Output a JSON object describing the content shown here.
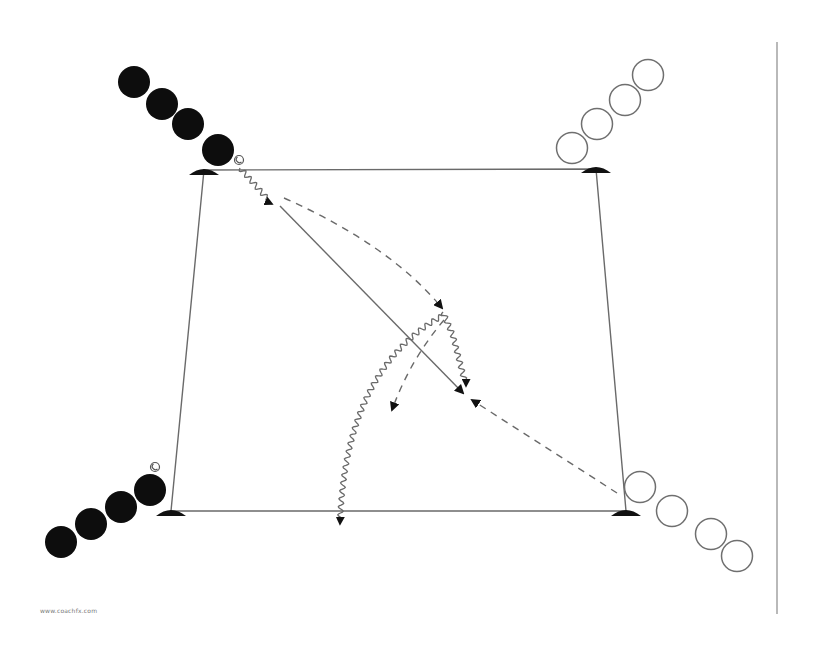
{
  "diagram": {
    "colors": {
      "line": "#6a6a6a",
      "dark_player": "#0d0d0d",
      "light_player_stroke": "#6f6f6f",
      "cone": "#111111",
      "arrow": "#111111",
      "divider": "#8a8a8a"
    },
    "pitch": {
      "corners": [
        {
          "name": "top-left",
          "x": 204,
          "y": 170
        },
        {
          "name": "top-right",
          "x": 596,
          "y": 169
        },
        {
          "name": "bottom-right",
          "x": 626,
          "y": 511
        },
        {
          "name": "bottom-left",
          "x": 171,
          "y": 511
        }
      ]
    },
    "cones": [
      {
        "name": "cone-top-left",
        "x": 204,
        "y": 172
      },
      {
        "name": "cone-top-right",
        "x": 596,
        "y": 170
      },
      {
        "name": "cone-bottom-left",
        "x": 171,
        "y": 513
      },
      {
        "name": "cone-bottom-right",
        "x": 626,
        "y": 513
      }
    ],
    "teams": {
      "dark": {
        "label": "Team A (filled)",
        "groups": [
          {
            "name": "dark-group-top-left",
            "players": [
              [
                134,
                82
              ],
              [
                162,
                104
              ],
              [
                188,
                124
              ],
              [
                218,
                150
              ]
            ]
          },
          {
            "name": "dark-group-bottom-left",
            "players": [
              [
                61,
                542
              ],
              [
                91,
                524
              ],
              [
                121,
                507
              ],
              [
                150,
                490
              ]
            ]
          }
        ]
      },
      "light": {
        "label": "Team B (outline)",
        "groups": [
          {
            "name": "light-group-top-right",
            "players": [
              [
                648,
                75
              ],
              [
                625,
                100
              ],
              [
                597,
                124
              ],
              [
                572,
                148
              ]
            ]
          },
          {
            "name": "light-group-bottom-right",
            "players": [
              [
                640,
                487
              ],
              [
                672,
                511
              ],
              [
                711,
                534
              ],
              [
                737,
                556
              ]
            ]
          }
        ]
      }
    },
    "balls": [
      {
        "name": "ball-top-left",
        "x": 239,
        "y": 160
      },
      {
        "name": "ball-bottom-left",
        "x": 155,
        "y": 467
      }
    ],
    "movements": [
      {
        "name": "dribble-start-top-left",
        "type": "dribble",
        "path": "M 240 168 L 272 204"
      },
      {
        "name": "pass-diagonal",
        "type": "pass",
        "path": "M 280 206 L 463 393"
      },
      {
        "name": "run-curved-dashed",
        "type": "run",
        "path": "M 284 198 Q 390 245 442 308"
      },
      {
        "name": "dribble-wave-center",
        "type": "dribble",
        "path": "M 443 312 L 453 336 L 466 386"
      },
      {
        "name": "run-dashed-back",
        "type": "run",
        "path": "M 617 493 L 472 400"
      },
      {
        "name": "dribble-long-curve",
        "type": "dribble",
        "path": "M 442 316 Q 345 370 340 524"
      },
      {
        "name": "run-dashed-short",
        "type": "run",
        "path": "M 444 320 Q 410 360 392 410"
      }
    ],
    "divider": {
      "x": 777,
      "y1": 42,
      "y2": 614
    },
    "watermark": "www.coachfx.com"
  }
}
